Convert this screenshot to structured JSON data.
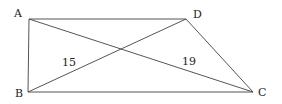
{
  "diagram": {
    "type": "quadrilateral",
    "points": {
      "A": {
        "label": "A",
        "x": 29,
        "y": 19
      },
      "B": {
        "label": "B",
        "x": 28,
        "y": 92
      },
      "C": {
        "label": "C",
        "x": 253,
        "y": 92
      },
      "D": {
        "label": "D",
        "x": 186,
        "y": 19
      }
    },
    "segments": [
      "AD",
      "AB",
      "BC",
      "DC",
      "AC",
      "BD"
    ],
    "measurements": [
      {
        "segment": "BD",
        "value": "15"
      },
      {
        "segment": "AC",
        "value": "19"
      }
    ],
    "line_color": "#555555"
  }
}
